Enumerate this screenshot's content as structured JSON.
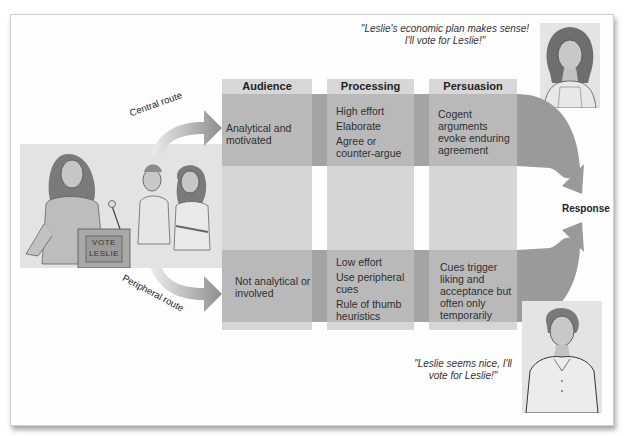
{
  "diagram": {
    "title_region": "Elaboration likelihood model of persuasion",
    "columns": [
      {
        "header": "Audience"
      },
      {
        "header": "Processing"
      },
      {
        "header": "Persuasion"
      }
    ],
    "central_route": {
      "label": "Central route",
      "audience": "Analytical and motivated",
      "processing": [
        "High effort",
        "Elaborate",
        "Agree or counter-argue"
      ],
      "persuasion": "Cogent arguments evoke enduring agreement"
    },
    "peripheral_route": {
      "label": "Peripheral route",
      "audience": "Not analytical or involved",
      "processing": [
        "Low effort",
        "Use peripheral cues",
        "Rule of thumb heuristics"
      ],
      "persuasion": "Cues trigger liking and acceptance but often only temporarily"
    },
    "outcome_label": "Response",
    "quotes": {
      "top": "\"Leslie's economic plan makes sense! I'll vote for Leslie!\"",
      "bottom": "\"Leslie seems nice, I'll vote for Leslie!\""
    },
    "illustration": {
      "podium_sign_line1": "VOTE",
      "podium_sign_line2": "LESLIE"
    },
    "colors": {
      "band_dark": "#b9b9b9",
      "band_light": "#d6d6d6",
      "header": "#d7d7d7",
      "arrow": "#9a9a9a"
    }
  }
}
